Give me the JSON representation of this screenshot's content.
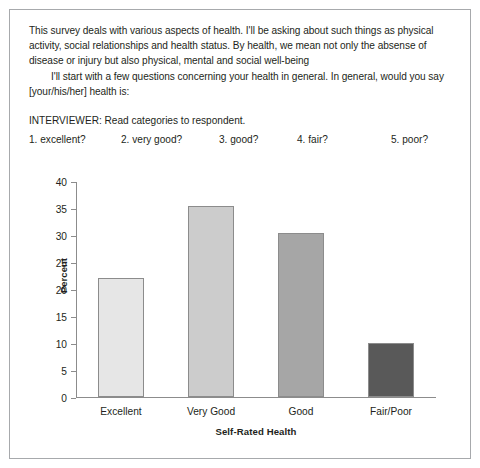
{
  "survey": {
    "paragraph_1": "This survey deals with various aspects of health. I'll be asking about such things as physical activity, social relationships and health status. By health, we mean not only the absense of disease or injury but also physical, mental and social well-being",
    "paragraph_2": "I'll start with a few questions concerning your health in general. In general, would you say [your/his/her] health is:",
    "interviewer_note": "INTERVIEWER: Read categories to respondent.",
    "options": [
      "1. excellent?",
      "2. very good?",
      "3. good?",
      "4. fair?",
      "5. poor?"
    ]
  },
  "chart_data": {
    "type": "bar",
    "title": "",
    "xlabel": "Self-Rated Health",
    "ylabel": "Percent",
    "ylim": [
      0,
      40
    ],
    "yticks": [
      0,
      5,
      10,
      15,
      20,
      25,
      30,
      35,
      40
    ],
    "grid": false,
    "legend": "none",
    "categories": [
      "Excellent",
      "Very Good",
      "Good",
      "Fair/Poor"
    ],
    "values": [
      22,
      35.3,
      30.3,
      10
    ],
    "bar_colors": [
      "#e6e6e6",
      "#cccccc",
      "#a6a6a6",
      "#595959"
    ],
    "bar_border_color": "#8c8c8c"
  },
  "colors": {
    "frame_border": "#a7a9ac",
    "axis": "#8c8c8c",
    "text": "#231f20",
    "background": "#ffffff"
  }
}
